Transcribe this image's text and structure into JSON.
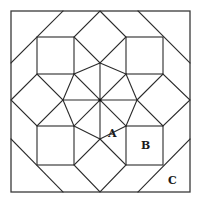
{
  "diagram": {
    "title": "",
    "type": "quilt-block-eight-point-star",
    "colors": {
      "line": "#2b2b2b",
      "frame": "#3a3a3a",
      "background": "#ffffff",
      "label": "#1a1a1a"
    },
    "frame": {
      "x1": 11,
      "y1": 11,
      "x2": 190,
      "y2": 192
    },
    "center": {
      "x": 100,
      "y": 100
    },
    "labels": [
      {
        "id": "A",
        "text": "A",
        "x": 113,
        "y": 136
      },
      {
        "id": "B",
        "text": "B",
        "x": 146,
        "y": 148
      },
      {
        "id": "C",
        "text": "C",
        "x": 172,
        "y": 183
      }
    ],
    "lines": [
      {
        "name": "star-vertical",
        "x1": 100,
        "y1": 52,
        "x2": 100,
        "y2": 139
      },
      {
        "name": "star-horizontal",
        "x1": 63,
        "y1": 100,
        "x2": 137,
        "y2": 100
      },
      {
        "name": "star-diagonal-main",
        "x1": 74,
        "y1": 74,
        "x2": 126,
        "y2": 126
      },
      {
        "name": "star-diagonal-anti",
        "x1": 126,
        "y1": 74,
        "x2": 74,
        "y2": 126
      }
    ],
    "polygons": [
      {
        "name": "top-diamond",
        "points": "100,11 137,48 100,63 63,48"
      },
      {
        "name": "square-top-left",
        "points": "37,37 74,37 74,74 37,74"
      },
      {
        "name": "square-top-right",
        "points": "126,37 163,37 163,74 126,74"
      },
      {
        "name": "square-bottom-left",
        "points": "37,126 74,126 74,165 37,165"
      },
      {
        "name": "square-bottom-right",
        "points": "126,126 163,126 163,165 126,165"
      },
      {
        "name": "left-diamond",
        "points": "11,100 37,74 63,100 37,126"
      },
      {
        "name": "right-diamond",
        "points": "137,100 163,74 190,100 163,126"
      },
      {
        "name": "bottom-diamond",
        "points": "100,139 126,165 100,192 74,165"
      }
    ]
  }
}
